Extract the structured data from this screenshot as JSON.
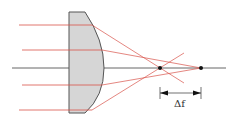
{
  "diagram": {
    "delta_f_label": "Δf",
    "colors": {
      "ray": "#d9534a",
      "axis": "#555555",
      "lens_fill": "#d6d6d6",
      "lens_stroke": "#555555",
      "focus_point": "#111111"
    },
    "lens": {
      "flat_x": 69,
      "top_y": 12,
      "bottom_y": 113,
      "vertex_x": 104
    },
    "axis": {
      "y": 68,
      "x_start": 12,
      "x_end": 226
    },
    "rays": [
      {
        "name": "outer-top",
        "y": 25,
        "x_start": 19,
        "exit_x": 92
      },
      {
        "name": "inner-top",
        "y": 50,
        "x_start": 22,
        "exit_x": 102
      },
      {
        "name": "inner-bottom",
        "y": 85,
        "x_start": 22,
        "exit_x": 102
      },
      {
        "name": "outer-bottom",
        "y": 110,
        "x_start": 19,
        "exit_x": 92
      }
    ],
    "focus_points": [
      {
        "name": "marginal-focus",
        "x": 160,
        "y": 68
      },
      {
        "name": "paraxial-focus",
        "x": 201,
        "y": 68
      }
    ],
    "delta_f": {
      "x1": 160,
      "x2": 201,
      "y": 93
    }
  }
}
